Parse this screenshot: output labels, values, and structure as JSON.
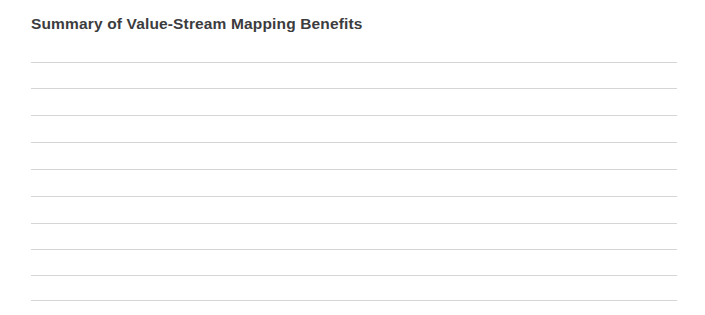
{
  "page": {
    "background_color": "#ffffff",
    "width": 705,
    "height": 315
  },
  "heading": {
    "text": "Summary of Value-Stream Mapping Benefits",
    "color": "#3c3c3e",
    "font_weight": "bold",
    "font_size_px": 15.5
  },
  "answer_area": {
    "type": "blank-ruled-lines",
    "line_count": 10,
    "line_color": "#d5d5d5",
    "line_thickness_px": 1,
    "left_px": 31,
    "right_px": 677,
    "line_length_px": 646,
    "first_line_y_px": 62,
    "line_spacing_px": 26.5,
    "lines": [
      {
        "index": 1,
        "y": 62,
        "value": ""
      },
      {
        "index": 2,
        "y": 88,
        "value": ""
      },
      {
        "index": 3,
        "y": 115,
        "value": ""
      },
      {
        "index": 4,
        "y": 142,
        "value": ""
      },
      {
        "index": 5,
        "y": 169,
        "value": ""
      },
      {
        "index": 6,
        "y": 196,
        "value": ""
      },
      {
        "index": 7,
        "y": 223,
        "value": ""
      },
      {
        "index": 8,
        "y": 249,
        "value": ""
      },
      {
        "index": 9,
        "y": 275,
        "value": ""
      },
      {
        "index": 10,
        "y": 300,
        "value": ""
      }
    ]
  }
}
